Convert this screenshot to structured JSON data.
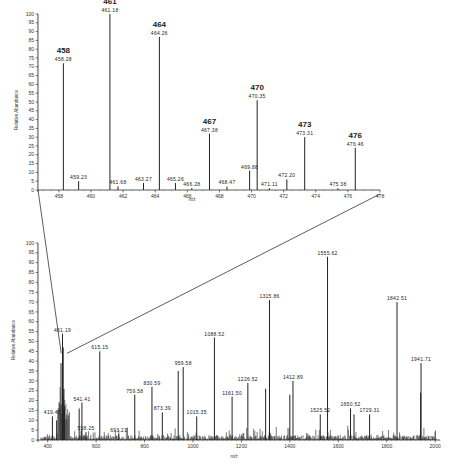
{
  "chart_data": [
    {
      "name": "inset",
      "type": "bar",
      "title": "",
      "xlabel": "m/z",
      "ylabel": "Relative Abundance",
      "xlim": [
        456.7,
        478
      ],
      "ylim": [
        0,
        100
      ],
      "grid": false,
      "x_ticks": [
        458,
        460,
        462,
        464,
        466,
        468,
        470,
        472,
        474,
        476,
        478
      ],
      "y_ticks": [
        0,
        5,
        10,
        15,
        20,
        25,
        30,
        35,
        40,
        45,
        50,
        55,
        60,
        65,
        70,
        75,
        80,
        85,
        90,
        95,
        100
      ],
      "peaks": [
        {
          "mz": 458.28,
          "intensity": 72,
          "label": "458.28",
          "series_label": "458"
        },
        {
          "mz": 459.23,
          "intensity": 5,
          "label": "459.23"
        },
        {
          "mz": 461.18,
          "intensity": 100,
          "label": "461.18",
          "series_label": "461"
        },
        {
          "mz": 461.68,
          "intensity": 2,
          "label": "461.68"
        },
        {
          "mz": 463.27,
          "intensity": 4,
          "label": "463.27"
        },
        {
          "mz": 464.26,
          "intensity": 87,
          "label": "464.26",
          "series_label": "464"
        },
        {
          "mz": 465.26,
          "intensity": 4,
          "label": "465.26"
        },
        {
          "mz": 466.28,
          "intensity": 1,
          "label": "466.28"
        },
        {
          "mz": 467.38,
          "intensity": 32,
          "label": "467.38",
          "series_label": "467"
        },
        {
          "mz": 468.47,
          "intensity": 2,
          "label": "468.47"
        },
        {
          "mz": 469.88,
          "intensity": 11,
          "label": "469.88"
        },
        {
          "mz": 470.35,
          "intensity": 51,
          "label": "470.35",
          "series_label": "470"
        },
        {
          "mz": 471.11,
          "intensity": 1,
          "label": "471.11"
        },
        {
          "mz": 472.2,
          "intensity": 6,
          "label": "472.20"
        },
        {
          "mz": 473.31,
          "intensity": 30,
          "label": "473.31",
          "series_label": "473"
        },
        {
          "mz": 475.38,
          "intensity": 1,
          "label": "475.38"
        },
        {
          "mz": 476.46,
          "intensity": 24,
          "label": "476.46",
          "series_label": "476"
        }
      ]
    },
    {
      "name": "full",
      "type": "bar",
      "title": "",
      "xlabel": "m/z",
      "ylabel": "Relative Abundance",
      "xlim": [
        360,
        2020
      ],
      "ylim": [
        0,
        100
      ],
      "grid": false,
      "x_ticks": [
        400,
        600,
        800,
        1000,
        1200,
        1400,
        1600,
        1800,
        2000
      ],
      "y_ticks": [
        0,
        5,
        10,
        15,
        20,
        25,
        30,
        35,
        40,
        45,
        50,
        55,
        60,
        65,
        70,
        75,
        80,
        85,
        90,
        95,
        100
      ],
      "peaks": [
        {
          "mz": 419.45,
          "intensity": 12,
          "label": "419.45"
        },
        {
          "mz": 437,
          "intensity": 10
        },
        {
          "mz": 455,
          "intensity": 39
        },
        {
          "mz": 461.19,
          "intensity": 54,
          "label": "461.19"
        },
        {
          "mz": 464,
          "intensity": 47
        },
        {
          "mz": 467,
          "intensity": 26
        },
        {
          "mz": 470,
          "intensity": 17
        },
        {
          "mz": 530,
          "intensity": 16
        },
        {
          "mz": 541.41,
          "intensity": 19,
          "label": "541.41"
        },
        {
          "mz": 558.25,
          "intensity": 4,
          "label": "558.25"
        },
        {
          "mz": 615.15,
          "intensity": 45,
          "label": "615.15"
        },
        {
          "mz": 693.21,
          "intensity": 3,
          "label": "693.21"
        },
        {
          "mz": 759.58,
          "intensity": 23,
          "label": "759.58"
        },
        {
          "mz": 830.59,
          "intensity": 27,
          "label": "830.59"
        },
        {
          "mz": 873.39,
          "intensity": 14,
          "label": "873.39"
        },
        {
          "mz": 939,
          "intensity": 35
        },
        {
          "mz": 959.58,
          "intensity": 37,
          "label": "959.58"
        },
        {
          "mz": 1015.35,
          "intensity": 12,
          "label": "1015.35"
        },
        {
          "mz": 1088.52,
          "intensity": 52,
          "label": "1088.52"
        },
        {
          "mz": 1161.5,
          "intensity": 22,
          "label": "1161.50"
        },
        {
          "mz": 1226.52,
          "intensity": 29,
          "label": "1226.52"
        },
        {
          "mz": 1300,
          "intensity": 26
        },
        {
          "mz": 1315.86,
          "intensity": 71,
          "label": "1315.86"
        },
        {
          "mz": 1400,
          "intensity": 23
        },
        {
          "mz": 1412.89,
          "intensity": 30,
          "label": "1412.89"
        },
        {
          "mz": 1525.52,
          "intensity": 13,
          "label": "1525.52"
        },
        {
          "mz": 1555.62,
          "intensity": 93,
          "label": "1555.62"
        },
        {
          "mz": 1650.52,
          "intensity": 16,
          "label": "1650.52"
        },
        {
          "mz": 1665,
          "intensity": 13
        },
        {
          "mz": 1729.31,
          "intensity": 13,
          "label": "1729.31"
        },
        {
          "mz": 1842.51,
          "intensity": 70,
          "label": "1842.51"
        },
        {
          "mz": 1941.71,
          "intensity": 39,
          "label": "1941.71"
        },
        {
          "mz": 1940,
          "intensity": 24
        }
      ]
    }
  ],
  "labels": {
    "inset_ylabel": "Relative Abundance",
    "inset_xlabel": "m/z",
    "full_ylabel": "Relative Abundance",
    "full_xlabel": "m/z"
  },
  "colors": {
    "line": "#333333",
    "peak": "#222222",
    "background": "#ffffff"
  }
}
